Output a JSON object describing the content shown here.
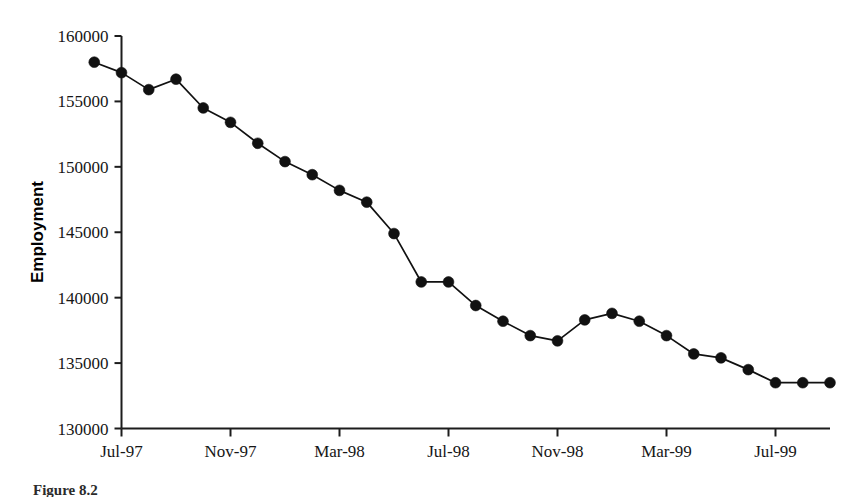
{
  "figure": {
    "caption": "Figure 8.2",
    "caption_visible_partial": true
  },
  "chart_data": {
    "type": "line",
    "title": "",
    "subtitle": "",
    "xlabel": "",
    "ylabel": "Employment",
    "ylim": [
      130000,
      160000
    ],
    "y_ticks": [
      130000,
      135000,
      140000,
      145000,
      150000,
      155000,
      160000
    ],
    "y_tick_labels": [
      "130000",
      "135000",
      "140000",
      "145000",
      "150000",
      "155000",
      "160000"
    ],
    "x_tick_labels": [
      "Jul-97",
      "Nov-97",
      "Mar-98",
      "Jul-98",
      "Nov-98",
      "Mar-99",
      "Jul-99"
    ],
    "x_tick_months": [
      "1997-07",
      "1997-11",
      "1998-03",
      "1998-07",
      "1998-11",
      "1999-03",
      "1999-07"
    ],
    "grid": false,
    "legend": "none",
    "marker": "filled-circle",
    "line_color": "#111111",
    "marker_color": "#111111",
    "x": [
      "1997-06",
      "1997-07",
      "1997-08",
      "1997-09",
      "1997-10",
      "1997-11",
      "1997-12",
      "1998-01",
      "1998-02",
      "1998-03",
      "1998-04",
      "1998-05",
      "1998-06",
      "1998-07",
      "1998-08",
      "1998-09",
      "1998-10",
      "1998-11",
      "1998-12",
      "1999-01",
      "1999-02",
      "1999-03",
      "1999-04",
      "1999-05",
      "1999-06",
      "1999-07",
      "1999-08",
      "1999-09"
    ],
    "categories": [
      "Jun-97",
      "Jul-97",
      "Aug-97",
      "Sep-97",
      "Oct-97",
      "Nov-97",
      "Dec-97",
      "Jan-98",
      "Feb-98",
      "Mar-98",
      "Apr-98",
      "May-98",
      "Jun-98",
      "Jul-98",
      "Aug-98",
      "Sep-98",
      "Oct-98",
      "Nov-98",
      "Dec-98",
      "Jan-99",
      "Feb-99",
      "Mar-99",
      "Apr-99",
      "May-99",
      "Jun-99",
      "Jul-99",
      "Aug-99",
      "Sep-99"
    ],
    "values": [
      158000,
      157200,
      155900,
      156700,
      154500,
      153400,
      151800,
      150400,
      149400,
      148200,
      147300,
      144900,
      141200,
      141200,
      139400,
      138200,
      137100,
      136700,
      138300,
      138800,
      138200,
      137100,
      135700,
      135400,
      134500,
      133500,
      133500,
      133500
    ],
    "series": [
      {
        "name": "Employment",
        "values": [
          158000,
          157200,
          155900,
          156700,
          154500,
          153400,
          151800,
          150400,
          149400,
          148200,
          147300,
          144900,
          141200,
          141200,
          139400,
          138200,
          137100,
          136700,
          138300,
          138800,
          138200,
          137100,
          135700,
          135400,
          134500,
          133500,
          133500,
          133500
        ]
      }
    ]
  }
}
